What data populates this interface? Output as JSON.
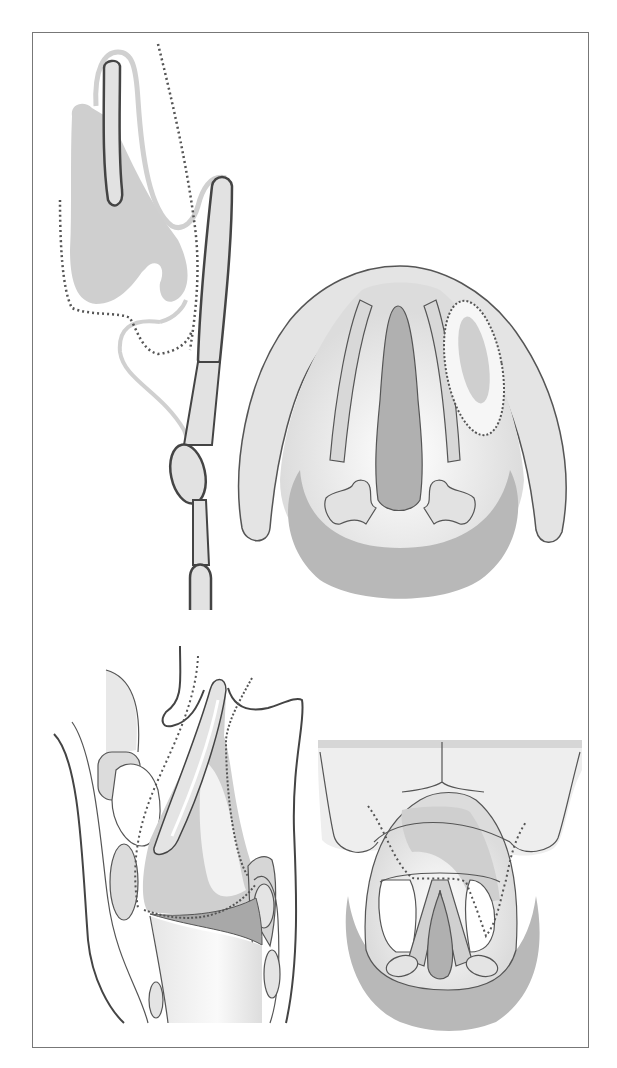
{
  "figure": {
    "panels": [
      {
        "id": "top-left",
        "view": "sagittal section, upper airway structures with dotted boundary line"
      },
      {
        "id": "top-right",
        "view": "endoscopic (superior) view of larynx with dotted outlined lesion region"
      },
      {
        "id": "bottom-left",
        "view": "sagittal section of larynx with dotted boundary lines"
      },
      {
        "id": "bottom-right",
        "view": "endoscopic view with arytenoids and dotted boundary line"
      }
    ],
    "colors": {
      "frame": "#777777",
      "outline_dark": "#444444",
      "outline_light": "#c8c8c8",
      "fill_light": "#e2e2e2",
      "fill_mid": "#cfcfcf",
      "fill_dark": "#b3b3b3",
      "dotted": "#555555",
      "background": "#ffffff"
    }
  }
}
